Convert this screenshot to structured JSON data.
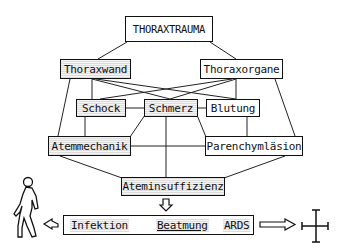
{
  "diagram": {
    "root": "THORAXTRAUMA",
    "level1": [
      "Thoraxwand",
      "Thoraxorgane"
    ],
    "level2": [
      "Schock",
      "Schmerz",
      "Blutung"
    ],
    "level3": [
      "Atemmechanik",
      "Parenchymläsion"
    ],
    "level4": "Ateminsuffizienz",
    "outcomes": [
      "Infektion",
      "Beatmung",
      "ARDS"
    ],
    "left_icon": "walking-person-icon",
    "right_icon": "cross-icon"
  }
}
